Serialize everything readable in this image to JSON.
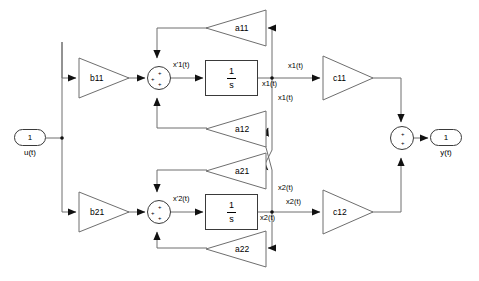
{
  "diagram": {
    "background_color": "#ffffff",
    "line_color": "#4a4a4a",
    "text_color": "#000000"
  },
  "ports": {
    "input": {
      "number": "1",
      "label": "u(t)"
    },
    "output": {
      "number": "1",
      "label": "y(t)"
    }
  },
  "gains": {
    "b11": "b11",
    "b21": "b21",
    "a11": "a11",
    "a12": "a12",
    "a21": "a21",
    "a22": "a22",
    "c11": "c11",
    "c12": "c12"
  },
  "integrators": {
    "top": {
      "numerator": "1",
      "denominator": "s"
    },
    "bottom": {
      "numerator": "1",
      "denominator": "s"
    }
  },
  "sums": {
    "top": {
      "signs": [
        "+",
        "+",
        "+"
      ]
    },
    "bottom": {
      "signs": [
        "+",
        "+",
        "+"
      ]
    },
    "output": {
      "signs": [
        "+",
        "+"
      ]
    }
  },
  "signals": {
    "xdot1": "x'1(t)",
    "xdot2": "x'2(t)",
    "x1_a": "x1(t)",
    "x1_b": "x1(t)",
    "x1_c": "x1(t)",
    "x2_a": "x2(t)",
    "x2_b": "x2(t)",
    "x2_c": "x2(t)"
  }
}
